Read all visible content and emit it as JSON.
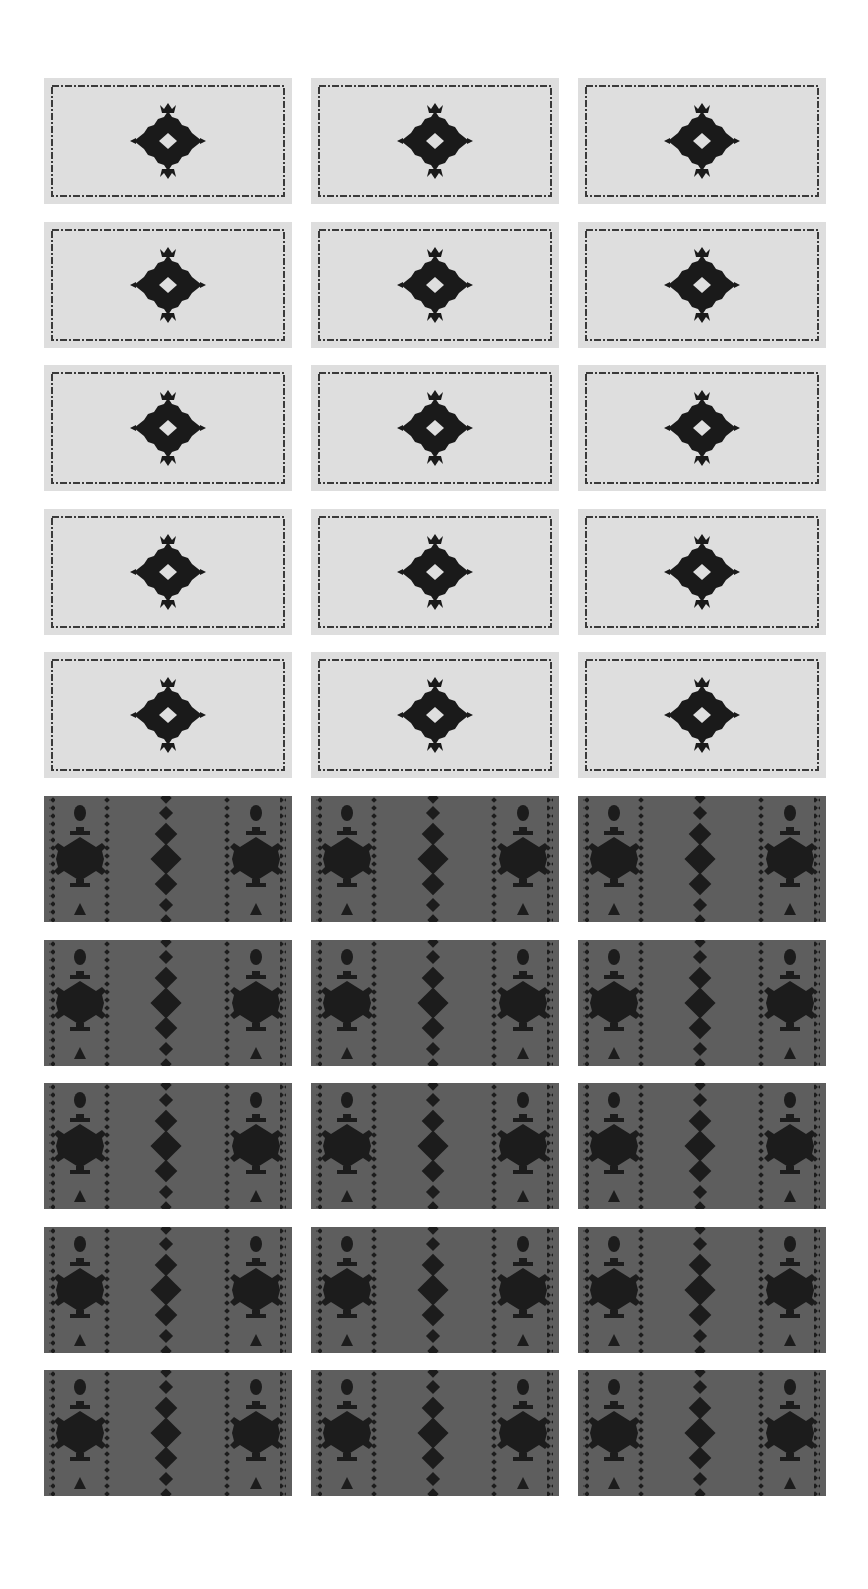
{
  "gallery": {
    "columns": 3,
    "rows": 10,
    "tile_width": 248,
    "tile_height": 126,
    "col_pitch": 267,
    "row_pitch": 143.6,
    "colors": {
      "page_background": "#ffffff",
      "light_tile": "#dedede",
      "light_border": "#3a3a3a",
      "motif": "#1a1a1a",
      "dark_tile": "#5e5e5e",
      "dark_pattern": "#1c1c1c"
    },
    "row_kinds": [
      "light",
      "light",
      "light",
      "light",
      "light",
      "dark",
      "dark",
      "dark",
      "dark",
      "dark"
    ],
    "tiles": {
      "light": {
        "label": "light tile with dashed border and central diamond medallion"
      },
      "dark": {
        "label": "dark tile with vertical dotted stripes, snowflake medallions and diamond column"
      }
    }
  }
}
